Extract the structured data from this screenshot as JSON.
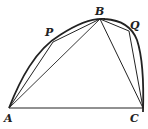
{
  "diagram": {
    "labels": {
      "A": "A",
      "B": "B",
      "C": "C",
      "P": "P",
      "Q": "Q"
    },
    "segments": [
      "A-P",
      "P-B",
      "A-B",
      "B-Q",
      "Q-C",
      "B-C",
      "A-C"
    ],
    "curve": "arc A-P-B-Q-C",
    "stroke_color": "#222222"
  }
}
